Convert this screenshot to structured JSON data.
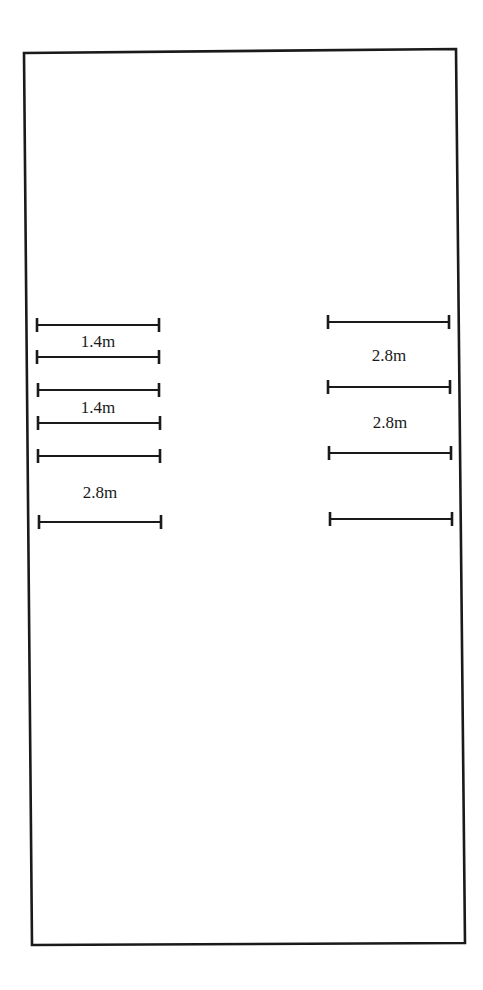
{
  "diagram": {
    "colors": {
      "background": "#ffffff",
      "stroke": "#1a1a1a"
    },
    "frame": {
      "corners": {
        "top_left": [
          24,
          53
        ],
        "top_right": [
          456,
          49
        ],
        "bottom_right": [
          465,
          943
        ],
        "bottom_left": [
          32,
          945
        ]
      }
    },
    "left_group": {
      "markers": [
        {
          "y": 325,
          "x1": 37,
          "x2": 159
        },
        {
          "y": 357,
          "x1": 37,
          "x2": 159
        },
        {
          "y": 390,
          "x1": 38,
          "x2": 159
        },
        {
          "y": 423,
          "x1": 38,
          "x2": 160
        },
        {
          "y": 456,
          "x1": 38,
          "x2": 160
        },
        {
          "y": 522,
          "x1": 39,
          "x2": 161
        }
      ],
      "labels": [
        {
          "text": "1.4m",
          "x": 98,
          "y": 347
        },
        {
          "text": "1.4m",
          "x": 98,
          "y": 413
        },
        {
          "text": "2.8m",
          "x": 100,
          "y": 498
        }
      ]
    },
    "right_group": {
      "markers": [
        {
          "y": 322,
          "x1": 328,
          "x2": 449
        },
        {
          "y": 387,
          "x1": 328,
          "x2": 450
        },
        {
          "y": 453,
          "x1": 329,
          "x2": 451
        },
        {
          "y": 519,
          "x1": 330,
          "x2": 452
        }
      ],
      "labels": [
        {
          "text": "2.8m",
          "x": 389,
          "y": 361
        },
        {
          "text": "2.8m",
          "x": 390,
          "y": 428
        }
      ]
    }
  }
}
